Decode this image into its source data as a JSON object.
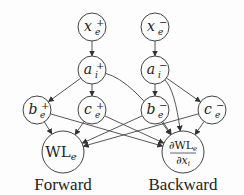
{
  "diagram": {
    "type": "computation-graph",
    "colors": {
      "stroke": "#444444",
      "text": "#222222",
      "background": "#fdfdfd"
    },
    "nodes": [
      {
        "id": "x_pos",
        "base": "x",
        "sub": "e",
        "sup": "+",
        "cx": 92,
        "cy": 27,
        "r": 14
      },
      {
        "id": "a_pos",
        "base": "a",
        "sub": "i",
        "sup": "+",
        "cx": 92,
        "cy": 70,
        "r": 14
      },
      {
        "id": "b_pos",
        "base": "b",
        "sub": "e",
        "sup": "+",
        "cx": 37,
        "cy": 110,
        "r": 14
      },
      {
        "id": "c_pos",
        "base": "c",
        "sub": "e",
        "sup": "+",
        "cx": 92,
        "cy": 110,
        "r": 14
      },
      {
        "id": "wl",
        "base": "WL",
        "sub": "e",
        "sup": "",
        "cx": 63,
        "cy": 152,
        "r": 21
      },
      {
        "id": "x_neg",
        "base": "x",
        "sub": "e",
        "sup": "−",
        "cx": 155,
        "cy": 27,
        "r": 14
      },
      {
        "id": "a_neg",
        "base": "a",
        "sub": "i",
        "sup": "−",
        "cx": 155,
        "cy": 70,
        "r": 14
      },
      {
        "id": "b_neg",
        "base": "b",
        "sub": "e",
        "sup": "−",
        "cx": 155,
        "cy": 110,
        "r": 14
      },
      {
        "id": "c_neg",
        "base": "c",
        "sub": "e",
        "sup": "−",
        "cx": 212,
        "cy": 110,
        "r": 14
      },
      {
        "id": "grad",
        "num": "∂WL",
        "num_sub": "e",
        "den": "∂x",
        "den_sub": "i",
        "cx": 183,
        "cy": 152,
        "r": 21
      }
    ],
    "edges": [
      {
        "from": "x_pos",
        "to": "a_pos"
      },
      {
        "from": "a_pos",
        "to": "b_pos"
      },
      {
        "from": "a_pos",
        "to": "c_pos"
      },
      {
        "from": "a_pos",
        "to": "grad",
        "curved": true
      },
      {
        "from": "b_pos",
        "to": "wl"
      },
      {
        "from": "c_pos",
        "to": "wl"
      },
      {
        "from": "b_pos",
        "to": "grad"
      },
      {
        "from": "c_pos",
        "to": "grad"
      },
      {
        "from": "x_neg",
        "to": "a_neg"
      },
      {
        "from": "a_neg",
        "to": "b_neg"
      },
      {
        "from": "a_neg",
        "to": "c_neg"
      },
      {
        "from": "a_neg",
        "to": "grad",
        "curved": true
      },
      {
        "from": "b_neg",
        "to": "wl"
      },
      {
        "from": "c_neg",
        "to": "wl"
      },
      {
        "from": "b_neg",
        "to": "grad"
      },
      {
        "from": "c_neg",
        "to": "grad"
      }
    ],
    "captions": {
      "forward": "Forward",
      "backward": "Backward"
    }
  }
}
